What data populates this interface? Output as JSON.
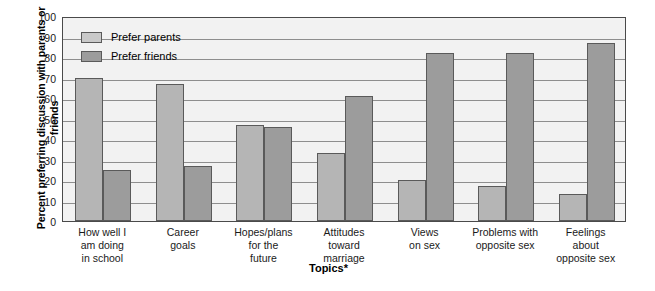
{
  "chart_data": {
    "type": "bar",
    "title": "",
    "xlabel": "Topics*",
    "ylabel": "Percent preferring discussion with parents or friends",
    "ylim": [
      0,
      100
    ],
    "ytick_step": 10,
    "grid": true,
    "legend_position": "top-left-inside",
    "categories": [
      "How well I\nam doing\nin school",
      "Career\ngoals",
      "Hopes/plans\nfor the\nfuture",
      "Attitudes\ntoward\nmarriage",
      "Views\non sex",
      "Problems with\nopposite sex",
      "Feelings\nabout\nopposite sex"
    ],
    "category_lines": [
      [
        "How well I",
        "am doing",
        "in school"
      ],
      [
        "Career",
        "goals"
      ],
      [
        "Hopes/plans",
        "for the",
        "future"
      ],
      [
        "Attitudes",
        "toward",
        "marriage"
      ],
      [
        "Views",
        "on sex"
      ],
      [
        "Problems with",
        "opposite sex"
      ],
      [
        "Feelings",
        "about",
        "opposite sex"
      ]
    ],
    "yticks": [
      100,
      90,
      80,
      70,
      60,
      50,
      40,
      30,
      20,
      10,
      0
    ],
    "series": [
      {
        "name": "Prefer parents",
        "color": "#b5b5b5",
        "values": [
          70,
          67,
          47,
          33,
          20,
          17,
          13
        ]
      },
      {
        "name": "Prefer friends",
        "color": "#9c9c9c",
        "values": [
          25,
          27,
          46,
          61,
          82,
          82,
          87
        ]
      }
    ]
  },
  "legend": {
    "items": [
      {
        "label": "Prefer parents",
        "swatch": "parents"
      },
      {
        "label": "Prefer friends",
        "swatch": "friends"
      }
    ]
  },
  "colors": {
    "parents_fill": "#b5b5b5",
    "friends_fill": "#9c9c9c",
    "plot_background": "#f2f2f2",
    "gridline": "#8e8e8e",
    "frame": "#4a4a4a",
    "text": "#1a1a1a"
  }
}
